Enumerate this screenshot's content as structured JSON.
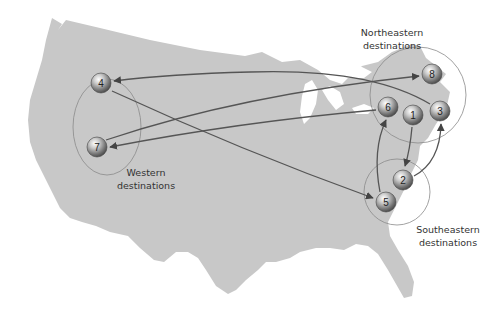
{
  "map": {
    "region": "Continental United States",
    "land_color": "#c8c8c8",
    "route_color": "#555555",
    "region_outline_color": "#8a8a8a"
  },
  "regions": [
    {
      "id": "western",
      "line1": "Western",
      "line2": "destinations",
      "members": [
        4,
        7
      ]
    },
    {
      "id": "northeastern",
      "line1": "Northeastern",
      "line2": "destinations",
      "members": [
        8,
        6,
        1,
        3
      ]
    },
    {
      "id": "southeastern",
      "line1": "Southeastern",
      "line2": "destinations",
      "members": [
        2,
        5
      ]
    }
  ],
  "nodes": [
    {
      "id": 1,
      "label": "1",
      "x": 413,
      "y": 115
    },
    {
      "id": 2,
      "label": "2",
      "x": 403,
      "y": 180
    },
    {
      "id": 3,
      "label": "3",
      "x": 440,
      "y": 111
    },
    {
      "id": 4,
      "label": "4",
      "x": 101,
      "y": 83
    },
    {
      "id": 5,
      "label": "5",
      "x": 386,
      "y": 202
    },
    {
      "id": 6,
      "label": "6",
      "x": 388,
      "y": 107
    },
    {
      "id": 7,
      "label": "7",
      "x": 97,
      "y": 147
    },
    {
      "id": 8,
      "label": "8",
      "x": 432,
      "y": 74
    }
  ],
  "routes": [
    {
      "from": 1,
      "to": 2
    },
    {
      "from": 2,
      "to": 3
    },
    {
      "from": 3,
      "to": 4
    },
    {
      "from": 4,
      "to": 5
    },
    {
      "from": 5,
      "to": 6
    },
    {
      "from": 6,
      "to": 7
    },
    {
      "from": 7,
      "to": 8
    }
  ]
}
